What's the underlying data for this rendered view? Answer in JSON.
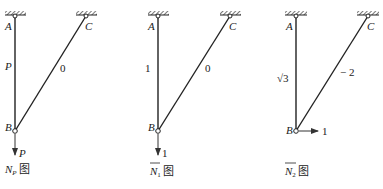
{
  "top_text_fragment": "",
  "diagrams": [
    {
      "id": "np",
      "caption_symbol": "N",
      "caption_subscript": "P",
      "caption_suffix": "图",
      "overline": false,
      "nodes": {
        "A": "A",
        "B": "B",
        "C": "C"
      },
      "member_AB_force": "P",
      "member_BC_force": "0",
      "load_label": "P",
      "load_direction": "down"
    },
    {
      "id": "n1",
      "caption_symbol": "N",
      "caption_subscript": "1",
      "caption_suffix": "图",
      "overline": true,
      "nodes": {
        "A": "A",
        "B": "B",
        "C": "C"
      },
      "member_AB_force": "1",
      "member_BC_force": "0",
      "load_label": "1",
      "load_direction": "down"
    },
    {
      "id": "n2",
      "caption_symbol": "N",
      "caption_subscript": "2",
      "caption_suffix": "图",
      "overline": true,
      "nodes": {
        "A": "A",
        "B": "B",
        "C": "C"
      },
      "member_AB_force": "√3",
      "member_BC_force": "− 2",
      "load_label": "1",
      "load_direction": "right"
    }
  ]
}
